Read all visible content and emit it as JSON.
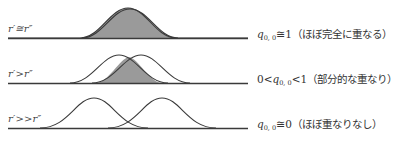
{
  "rows": [
    {
      "condition": "r′≅r″",
      "prefix": "",
      "q_symbol": "q",
      "q_subscript": "0, 0",
      "relation": "≅1",
      "note": "（ほぼ完全に重なる）"
    },
    {
      "condition": "r′>r″",
      "prefix": "0<",
      "q_symbol": "q",
      "q_subscript": "0, 0",
      "relation": "<1",
      "note": "（部分的な重なり）"
    },
    {
      "condition": "r′>>r″",
      "prefix": "",
      "q_symbol": "q",
      "q_subscript": "0, 0",
      "relation": "≅0",
      "note": "（ほぼ重なりなし）"
    }
  ],
  "colors": {
    "curve": "#3a3a3a",
    "overlap_fill": "#9a9a9a",
    "baseline": "#3a3a3a"
  }
}
